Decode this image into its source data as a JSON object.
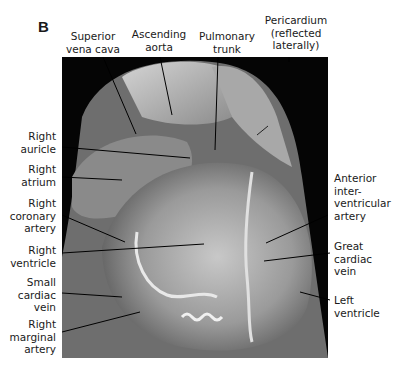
{
  "figure": {
    "panel_letter": "B"
  },
  "labels": {
    "top": [
      {
        "id": "superior-vena-cava",
        "text": "Superior\nvena cava"
      },
      {
        "id": "ascending-aorta",
        "text": "Ascending\naorta"
      },
      {
        "id": "pulmonary-trunk",
        "text": "Pulmonary\ntrunk"
      },
      {
        "id": "pericardium",
        "text": "Pericardium\n(reflected\nlaterally)"
      }
    ],
    "left": [
      {
        "id": "right-auricle",
        "text": "Right\nauricle"
      },
      {
        "id": "right-atrium",
        "text": "Right\natrium"
      },
      {
        "id": "right-coronary-artery",
        "text": "Right\ncoronary\nartery"
      },
      {
        "id": "right-ventricle",
        "text": "Right\nventricle"
      },
      {
        "id": "small-cardiac-vein",
        "text": "Small\ncardiac\nvein"
      },
      {
        "id": "right-marginal-artery",
        "text": "Right\nmarginal\nartery"
      }
    ],
    "right": [
      {
        "id": "anterior-interventricular-artery",
        "text": "Anterior\ninter-\nventricular\nartery"
      },
      {
        "id": "great-cardiac-vein",
        "text": "Great\ncardiac\nvein"
      },
      {
        "id": "left-ventricle",
        "text": "Left\nventricle"
      }
    ]
  }
}
